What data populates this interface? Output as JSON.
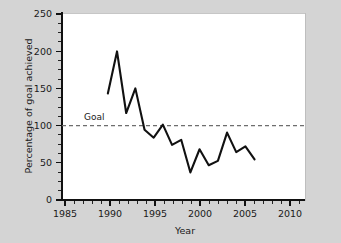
{
  "chart_data": {
    "type": "line",
    "title": "",
    "xlabel": "Year",
    "ylabel": "Percentage of goal achieved",
    "xlim": [
      1985,
      2011.5
    ],
    "ylim": [
      0,
      258
    ],
    "grid": false,
    "legend_position": "none",
    "x": [
      1990,
      1991,
      1992,
      1993,
      1994,
      1995,
      1996,
      1997,
      1998,
      1999,
      2000,
      2001,
      2002,
      2003,
      2004,
      2005,
      2006
    ],
    "values": [
      147,
      205,
      120,
      154,
      97,
      86,
      104,
      76,
      83,
      38,
      70,
      48,
      54,
      93,
      66,
      74,
      56
    ],
    "series": [
      {
        "name": "Percentage of goal achieved",
        "values": [
          147,
          205,
          120,
          154,
          97,
          86,
          104,
          76,
          83,
          38,
          70,
          48,
          54,
          93,
          66,
          74,
          56
        ]
      }
    ],
    "x_ticks": [
      1985,
      1990,
      1995,
      2000,
      2005,
      2010
    ],
    "x_tick_labels": [
      "1985",
      "1990",
      "1995",
      "2000",
      "2005",
      "2010"
    ],
    "x_minor_step": 1,
    "y_ticks": [
      0,
      50,
      100,
      150,
      200,
      250
    ],
    "y_tick_labels": [
      "0",
      "50",
      "100",
      "150",
      "200",
      "250"
    ],
    "y_minor_step": 12.5,
    "annotations": [
      {
        "name": "goal-reference-line",
        "label": "Goal",
        "value": 100,
        "style": "dashed-horizontal",
        "label_x": 1991.2
      }
    ],
    "colors": {
      "line": "#111111",
      "goal_line": "#6e6e6e",
      "plot_background": "#ffffff",
      "figure_background": "#d4d4d4",
      "axis": "#111111",
      "text": "#1a1a1a"
    }
  },
  "labels": {
    "x_axis_title": "Year",
    "y_axis_title": "Percentage of goal achieved",
    "goal_annotation": "Goal",
    "y_tick_0": "0",
    "y_tick_50": "50",
    "y_tick_100": "100",
    "y_tick_150": "150",
    "y_tick_200": "200",
    "y_tick_250": "250",
    "x_tick_1985": "1985",
    "x_tick_1990": "1990",
    "x_tick_1995": "1995",
    "x_tick_2000": "2000",
    "x_tick_2005": "2005",
    "x_tick_2010": "2010"
  }
}
